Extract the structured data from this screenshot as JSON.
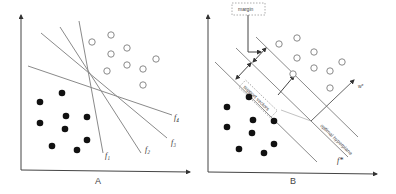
{
  "panels": {
    "a": {
      "caption": "A",
      "lines": [
        {
          "label": "f1",
          "display": "f₁"
        },
        {
          "label": "f2",
          "display": "f₂"
        },
        {
          "label": "f3",
          "display": "f₃"
        },
        {
          "label": "f4",
          "display": "f₄"
        }
      ],
      "open_points_count": 9,
      "filled_points_count": 9
    },
    "b": {
      "caption": "B",
      "margin_label": "margin",
      "support_vectors_label": "support vectors",
      "optimal_hyperplane_label": "optimal hyperplane",
      "normal_label": "w*",
      "function_label": "f*",
      "open_points_count": 9,
      "filled_points_count": 9
    }
  }
}
